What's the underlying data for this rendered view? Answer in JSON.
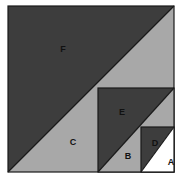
{
  "figure": {
    "kind": "nested-squares-diagonal-split",
    "canvas": {
      "width": 193,
      "height": 185,
      "background": "#ffffff"
    },
    "colors": {
      "dark_gray": "#3d3d3d",
      "light_gray": "#a8a8a8",
      "white": "#ffffff",
      "outline": "#1a1a1a",
      "label_text": "#111111"
    },
    "squares": [
      {
        "name": "outer-square",
        "x": 8,
        "y": 6,
        "size": 166,
        "upper_left_region": "F",
        "lower_right_region": "C"
      },
      {
        "name": "middle-square",
        "x": 98,
        "y": 88,
        "size": 84,
        "upper_left_region": "E",
        "lower_right_region": "B"
      },
      {
        "name": "small-square",
        "x": 141,
        "y": 127,
        "size": 45,
        "upper_left_region": "D",
        "lower_right_region": "A"
      }
    ],
    "regions": [
      {
        "id": "F",
        "label": "F",
        "fill": "dark_gray",
        "label_x": 63,
        "label_y": 50
      },
      {
        "id": "C",
        "label": "C",
        "fill": "light_gray",
        "label_x": 73,
        "label_y": 143
      },
      {
        "id": "E",
        "label": "E",
        "fill": "dark_gray",
        "label_x": 122,
        "label_y": 113
      },
      {
        "id": "B",
        "label": "B",
        "fill": "light_gray",
        "label_x": 128,
        "label_y": 157
      },
      {
        "id": "D",
        "label": "D",
        "fill": "dark_gray",
        "label_x": 155,
        "label_y": 144
      },
      {
        "id": "A",
        "label": "A",
        "fill": "white",
        "label_x": 171,
        "label_y": 163
      }
    ]
  }
}
